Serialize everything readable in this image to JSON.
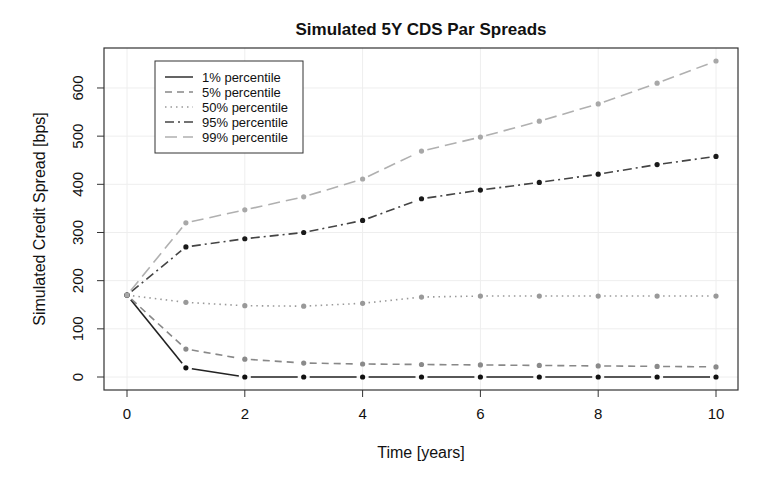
{
  "chart_data": {
    "type": "line",
    "title": "Simulated 5Y CDS Par Spreads",
    "xlabel": "Time [years]",
    "ylabel": "Simulated Credit Spread [bps]",
    "xlim": [
      -0.4,
      10.4
    ],
    "ylim": [
      -25,
      680
    ],
    "x_ticks": [
      0,
      2,
      4,
      6,
      8,
      10
    ],
    "y_ticks": [
      0,
      100,
      200,
      300,
      400,
      500,
      600
    ],
    "grid": true,
    "legend_position": "top-left",
    "x": [
      0,
      1,
      2,
      3,
      4,
      5,
      6,
      7,
      8,
      9,
      10
    ],
    "series": [
      {
        "name": "1% percentile",
        "values": [
          170,
          19,
          0,
          0,
          0,
          0,
          0,
          0,
          0,
          0,
          0
        ],
        "color": "#222222",
        "point_color": "#111111",
        "dash": "",
        "width": 1.6
      },
      {
        "name": "5% percentile",
        "values": [
          170,
          58,
          37,
          29,
          27,
          26,
          25,
          24,
          23,
          22,
          21
        ],
        "color": "#888888",
        "point_color": "#8a8a8a",
        "dash": "7,5",
        "width": 1.6
      },
      {
        "name": "50% percentile",
        "values": [
          170,
          155,
          148,
          147,
          153,
          166,
          168,
          168,
          168,
          168,
          168
        ],
        "color": "#999999",
        "point_color": "#999999",
        "dash": "1.5,4",
        "width": 1.6
      },
      {
        "name": "95% percentile",
        "values": [
          170,
          270,
          287,
          300,
          325,
          370,
          388,
          404,
          421,
          441,
          458
        ],
        "color": "#444444",
        "point_color": "#1a1a1a",
        "dash": "9,4,2,4",
        "width": 1.6
      },
      {
        "name": "99% percentile",
        "values": [
          170,
          320,
          347,
          374,
          411,
          469,
          498,
          531,
          567,
          610,
          656
        ],
        "color": "#b0b0b0",
        "point_color": "#a8a8a8",
        "dash": "12,6",
        "width": 1.6
      }
    ]
  }
}
